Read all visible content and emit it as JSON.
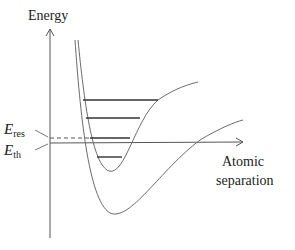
{
  "diagram": {
    "type": "potential-energy-curves",
    "y_axis_label": "Energy",
    "x_axis_label_line1": "Atomic",
    "x_axis_label_line2": "separation",
    "e_res": {
      "symbol": "E",
      "subscript": "res"
    },
    "e_th": {
      "symbol": "E",
      "subscript": "th"
    },
    "curves": [
      {
        "name": "upper-bound-potential",
        "description": "Bound excited-state well with vibrational levels"
      },
      {
        "name": "lower-ground-potential",
        "description": "Deeper ground-state well"
      }
    ],
    "vibrational_levels_count": 4,
    "colors": {
      "curve": "#6b6b6b",
      "axis": "#555555",
      "level": "#333333",
      "text": "#222222"
    }
  }
}
